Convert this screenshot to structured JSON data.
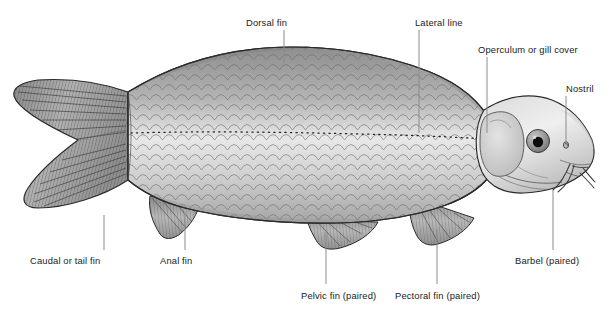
{
  "figure": {
    "background_color": "#ffffff",
    "label_color": "#1b1b1b",
    "leader_color": "#8c8c8c",
    "outline_color": "#2a2a2a"
  },
  "labels": [
    {
      "id": "dorsal-fin",
      "text": "Dorsal fin",
      "x": 246,
      "y": 18,
      "align": "left",
      "leader": {
        "x1": 284,
        "y1": 30,
        "x2": 284,
        "y2": 63
      }
    },
    {
      "id": "lateral-line",
      "text": "Lateral line",
      "x": 415,
      "y": 18,
      "align": "left",
      "leader": {
        "x1": 419,
        "y1": 30,
        "x2": 419,
        "y2": 133
      }
    },
    {
      "id": "operculum",
      "text": "Operculum or gill cover",
      "x": 478,
      "y": 45,
      "align": "left",
      "leader": {
        "x1": 487,
        "y1": 57,
        "x2": 487,
        "y2": 133
      }
    },
    {
      "id": "nostril",
      "text": "Nostril",
      "x": 566,
      "y": 84,
      "align": "left",
      "leader": {
        "x1": 566,
        "y1": 96,
        "x2": 566,
        "y2": 145
      }
    },
    {
      "id": "caudal-fin",
      "text": "Caudal or tail fin",
      "x": 30,
      "y": 256,
      "align": "left",
      "leader": {
        "x1": 104,
        "y1": 215,
        "x2": 104,
        "y2": 250
      }
    },
    {
      "id": "anal-fin",
      "text": "Anal fin",
      "x": 160,
      "y": 256,
      "align": "left",
      "leader": {
        "x1": 185,
        "y1": 213,
        "x2": 185,
        "y2": 250
      }
    },
    {
      "id": "pelvic-fin",
      "text": "Pelvic fin (paired)",
      "x": 301,
      "y": 291,
      "align": "left",
      "leader": {
        "x1": 326,
        "y1": 229,
        "x2": 326,
        "y2": 284
      }
    },
    {
      "id": "pectoral-fin",
      "text": "Pectoral fin (paired)",
      "x": 395,
      "y": 291,
      "align": "left",
      "leader": {
        "x1": 437,
        "y1": 229,
        "x2": 437,
        "y2": 284
      }
    },
    {
      "id": "barbel",
      "text": "Barbel (paired)",
      "x": 515,
      "y": 256,
      "align": "left",
      "leader": {
        "x1": 553,
        "y1": 190,
        "x2": 553,
        "y2": 250
      }
    }
  ],
  "anatomy": {
    "eye": {
      "iris_color": "#9a9a9a",
      "pupil_color": "#0d0d0d"
    },
    "lateral_line_style": "dotted",
    "scale_pattern": "overlapping-cycloid",
    "fin_pattern": "ray-hatching"
  }
}
